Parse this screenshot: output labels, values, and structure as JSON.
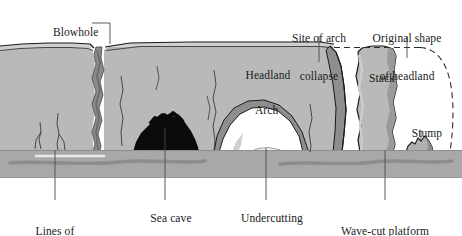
{
  "figure": {
    "width": 462,
    "height": 236
  },
  "colors": {
    "background": "#ffffff",
    "cliff_face": "#b9b9b9",
    "cliff_shadow": "#8e8e8e",
    "cliff_top_band": "#c9c9c9",
    "sea_water": "#a8a8a8",
    "sea_dark_streak": "#8d8d8d",
    "sea_cave_rock": "#0b0b0b",
    "outline": "#1a1a1a",
    "label_text": "#1a1a1a",
    "leader_line": "#4a4a4a",
    "dashed_original_shape": "#2b2b2b",
    "arch_opening": "#ffffff",
    "foam": "#f2f2f2"
  },
  "labels": [
    {
      "id": "blowhole",
      "name": "label-blowhole",
      "text": "Blowhole",
      "x": 41,
      "y": 19,
      "align": "left",
      "leader": "elbow-right-down"
    },
    {
      "id": "site_of_arch_collapse",
      "name": "label-site-of-arch-collapse",
      "text": "Site of arch\ncollapse",
      "line1": "Site of arch",
      "line2": "collapse",
      "x": 319,
      "y": 8,
      "align": "center",
      "leader": "vertical-down"
    },
    {
      "id": "original_shape_of_headland",
      "name": "label-original-shape-of-headland",
      "text": "Original shape\nof headland",
      "line1": "Original shape",
      "line2": "of headland",
      "x": 407,
      "y": 8,
      "align": "center",
      "leader": "vertical-down"
    },
    {
      "id": "headland",
      "name": "label-headland",
      "text": "Headland",
      "x": 262,
      "y": 61,
      "align": "center",
      "leader": "none"
    },
    {
      "id": "stack",
      "name": "label-stack",
      "text": "Stack",
      "x": 375,
      "y": 64,
      "align": "center",
      "leader": "none"
    },
    {
      "id": "arch",
      "name": "label-arch",
      "text": "Arch",
      "x": 261,
      "y": 96,
      "align": "center",
      "leader": "none"
    },
    {
      "id": "stump",
      "name": "label-stump",
      "text": "Stump",
      "x": 421,
      "y": 118,
      "align": "center",
      "leader": "vertical-down"
    },
    {
      "id": "lines_of_weakness",
      "name": "label-lines-of-weakness",
      "text": "Lines of\nweakness",
      "line1": "Lines of",
      "line2": "weakness",
      "x": 55,
      "y": 204,
      "align": "center",
      "leader": "vertical-up"
    },
    {
      "id": "sea_cave",
      "name": "label-sea-cave",
      "text": "Sea cave",
      "x": 165,
      "y": 204,
      "align": "center",
      "leader": "vertical-up"
    },
    {
      "id": "undercutting",
      "name": "label-undercutting",
      "text": "Undercutting",
      "x": 266,
      "y": 204,
      "align": "center",
      "leader": "vertical-up"
    },
    {
      "id": "wave_cut_platform",
      "name": "label-wave-cut-platform",
      "text": "Wave-cut platform\nexposed at low tide",
      "line1": "Wave-cut platform",
      "line2": "exposed at low tide",
      "x": 385,
      "y": 204,
      "align": "center",
      "leader": "vertical-up"
    }
  ],
  "features": {
    "blowhole_note": "dark sinuous vertical fissure through cliff at x~98",
    "sea_cave_note": "black lumpy rock mound at cliff base, x 133-198",
    "arch_note": "white arch opening beneath headland, x 215-305",
    "stack_note": "isolated pillar of rock, x 355-398",
    "stump_note": "low eroded remnant of rock at water level, x 405-432",
    "water_band": {
      "top": 150,
      "bottom": 178
    },
    "cliff_top": 46
  }
}
